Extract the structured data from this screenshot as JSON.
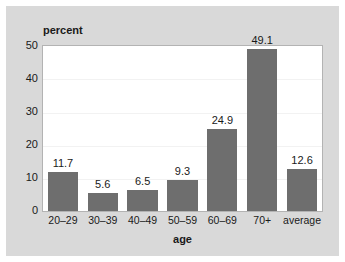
{
  "chart_data": {
    "type": "bar",
    "title": "",
    "xlabel": "age",
    "ylabel": "percent",
    "categories": [
      "20–29",
      "30–39",
      "40–49",
      "50–59",
      "60–69",
      "70+",
      "average"
    ],
    "values": [
      11.7,
      5.6,
      6.5,
      9.3,
      24.9,
      49.1,
      12.6
    ],
    "value_labels": [
      "11.7",
      "5.6",
      "6.5",
      "9.3",
      "24.9",
      "49.1",
      "12.6"
    ],
    "ylim": [
      0,
      50
    ],
    "yticks": [
      0,
      10,
      20,
      30,
      40,
      50
    ],
    "ytick_labels": [
      "0",
      "10",
      "20",
      "30",
      "40",
      "50"
    ],
    "grid": true,
    "legend": null,
    "bar_color": "#6e6e6e",
    "plot_background": "#ffffff",
    "figure_background": "#d9d9d9",
    "text_color": "#1a1a1a"
  }
}
